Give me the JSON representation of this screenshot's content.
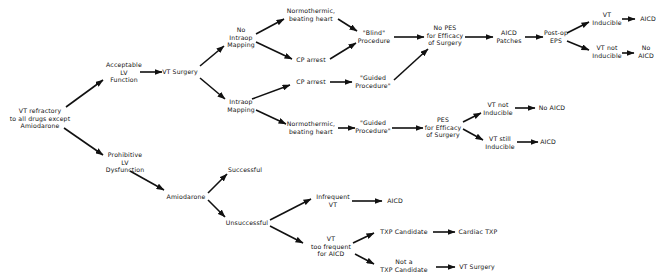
{
  "diagram": {
    "type": "flowchart",
    "colors": {
      "line": "#111111",
      "text": "#111111",
      "background": "#ffffff"
    },
    "nodes": {
      "root": "VT refractory\nto all drugs except\nAmiodarone",
      "acceptable_lv": "Acceptable\nLV\nFunction",
      "vt_surgery": "VT Surgery",
      "no_intraop_mapping": "No\nIntraop\nMapping",
      "intraop_mapping": "Intraop\nMapping",
      "normothermic_top": "Normothermic,\nbeating heart",
      "cp_arrest_top": "CP arrest",
      "cp_arrest_mid": "CP arrest",
      "normothermic_bottom": "Normothermic,\nbeating heart",
      "blind_procedure": "\"Blind\"\nProcedure",
      "guided_procedure_mid": "\"Guided\nProcedure\"",
      "guided_procedure_bottom": "\"Guided\nProcedure\"",
      "no_pes": "No PES\nfor Efficacy\nof Surgery",
      "aicd_patches": "AICD\nPatches",
      "postop_eps": "Post-op\nEPS",
      "vt_inducible_top": "VT\nInducible",
      "aicd_top": "AICD",
      "vt_not_inducible_top": "VT not\nInducible",
      "no_aicd_top": "No\nAICD",
      "pes_bottom": "PES\nfor Efficacy\nof Surgery",
      "vt_not_inducible_mid": "VT not\nInducible",
      "no_aicd_mid": "No AICD",
      "vt_still_inducible": "VT still\nInducible",
      "aicd_mid": "AICD",
      "prohibitive_lv": "Prohibitive\nLV\nDysfunction",
      "amiodarone": "Amiodarone",
      "successful": "Successful",
      "unsuccessful": "Unsuccessful",
      "infrequent_vt": "Infrequent\nVT",
      "aicd_bottom": "AICD",
      "vt_too_frequent": "VT\ntoo frequent\nfor AICD",
      "txp_candidate": "TXP Candidate",
      "cardiac_txp": "Cardiac TXP",
      "not_txp_candidate": "Not a\nTXP Candidate",
      "vt_surgery_bottom": "VT Surgery"
    }
  }
}
